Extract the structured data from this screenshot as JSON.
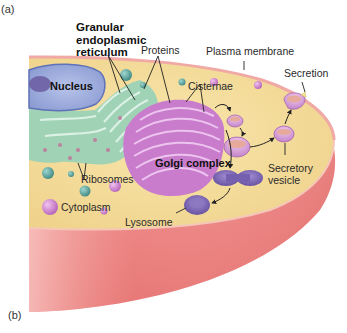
{
  "figure": {
    "panel_a": "(a)",
    "panel_b": "(b)"
  },
  "labels": {
    "granular_er": [
      "Granular",
      "endoplasmic",
      "reticulum"
    ],
    "proteins": "Proteins",
    "plasma_membrane": "Plasma membrane",
    "secretion": "Secretion",
    "nucleus": "Nucleus",
    "cisternae": "Cisternae",
    "golgi_complex": "Golgi complex",
    "secretory_vesicle": [
      "Secretory",
      "vesicle"
    ],
    "ribosomes": "Ribosomes",
    "cytoplasm": "Cytoplasm",
    "lysosome": "Lysosome"
  },
  "colors": {
    "cytoplasm": "#f3dd98",
    "membrane_body": "#ef8c8c",
    "nucleus": "#a9b6e0",
    "er": "#8ccfb4",
    "golgi": "#c678c8",
    "vesicle": "#d9a2dd",
    "lysosome": "#7a60b0",
    "ribosome": "#4e9a94"
  }
}
